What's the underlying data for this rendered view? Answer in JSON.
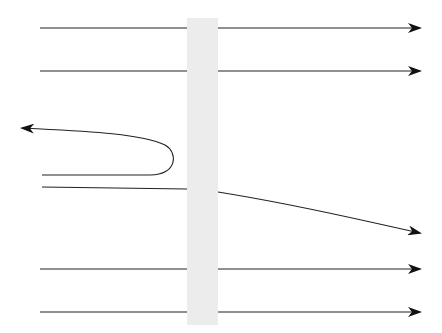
{
  "diagram": {
    "title": "",
    "colors": {
      "line": "#222222",
      "barrier": "#ececec",
      "background": "#ffffff"
    },
    "barrier": {
      "x": 187,
      "y": 18,
      "width": 31,
      "height": 307
    },
    "trajectories": [
      {
        "id": "transmitted-1",
        "kind": "straight",
        "y": 28
      },
      {
        "id": "transmitted-2",
        "kind": "straight",
        "y": 71
      },
      {
        "id": "reflected",
        "kind": "reflected"
      },
      {
        "id": "deflected",
        "kind": "deflected"
      },
      {
        "id": "transmitted-3",
        "kind": "straight",
        "y": 269
      },
      {
        "id": "transmitted-4",
        "kind": "straight",
        "y": 312
      }
    ]
  }
}
